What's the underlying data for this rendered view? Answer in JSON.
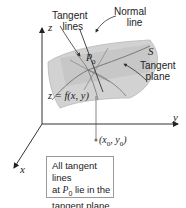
{
  "figure": {
    "axes": {
      "z_label": "z",
      "y_label": "y",
      "x_label": "x"
    },
    "labels": {
      "tangent_lines": [
        "Tangent",
        "lines"
      ],
      "normal_line": [
        "Normal",
        "line"
      ],
      "surface": "S",
      "tangent_plane": [
        "Tangent",
        "plane"
      ],
      "point": "P",
      "point_sub": "0",
      "equation": "z = f(x, y)",
      "base_point": "(x",
      "base_point_sub0": "0",
      "base_point_mid": ", y",
      "base_point_sub1": "0",
      "base_point_end": ")"
    },
    "callout": {
      "line1": "All tangent lines",
      "line2_pre": "at ",
      "line2_p": "P",
      "line2_sub": "0",
      "line2_post": " lie in the",
      "line3": "tangent plane."
    },
    "colors": {
      "surface": "#c9c9c9",
      "plane": "#b5b5b5",
      "axis": "#333333",
      "lines": "#555555"
    }
  }
}
